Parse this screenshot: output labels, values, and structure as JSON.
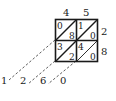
{
  "diagram": {
    "type": "lattice-multiplication",
    "multiplicand": {
      "digits": [
        "4",
        "5"
      ]
    },
    "multiplier": {
      "digits": [
        "2",
        "8"
      ]
    },
    "cells": [
      {
        "row": 0,
        "col": 0,
        "tens": "0",
        "ones": "8"
      },
      {
        "row": 0,
        "col": 1,
        "tens": "1",
        "ones": "0"
      },
      {
        "row": 1,
        "col": 0,
        "tens": "3",
        "ones": "2"
      },
      {
        "row": 1,
        "col": 1,
        "tens": "4",
        "ones": "0"
      }
    ],
    "result": {
      "digits": [
        "1",
        "2",
        "6",
        "0"
      ]
    }
  }
}
